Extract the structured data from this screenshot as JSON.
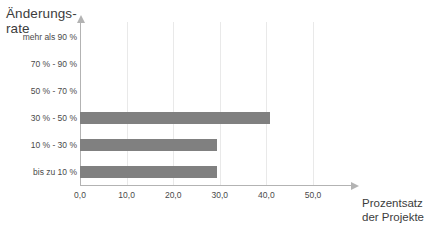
{
  "chart": {
    "y_axis_title": "Änderungs-\nrate",
    "x_axis_title": "Prozentsatz\nder Projekte"
  },
  "chart_data": {
    "type": "bar",
    "orientation": "horizontal",
    "title": "",
    "subtitle": "",
    "xlabel": "Prozentsatz der Projekte",
    "ylabel": "Änderungsrate",
    "categories": [
      "mehr als 90 %",
      "70 % - 90 %",
      "50 % - 70 %",
      "30 % - 50 %",
      "10 % - 30 %",
      "bis zu 10 %"
    ],
    "values": [
      0,
      0,
      0,
      40.8,
      29.5,
      29.5
    ],
    "xlim": [
      0,
      55
    ],
    "ylim": null,
    "xticks": [
      0,
      10,
      20,
      30,
      40,
      50
    ],
    "xticklabels": [
      "0,0",
      "10,0",
      "20,0",
      "30,0",
      "40,0",
      "50,0"
    ],
    "grid": "vertical",
    "legend": null,
    "bar_color": "#808080",
    "grid_color": "#e9e9e9",
    "axis_color": "#b3b3b3"
  }
}
